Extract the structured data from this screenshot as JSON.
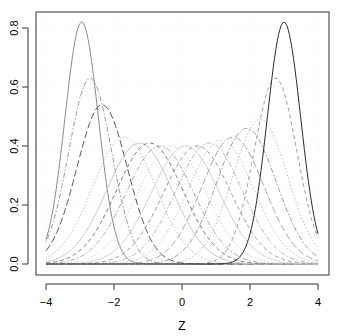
{
  "chart_data": {
    "type": "line",
    "title": "",
    "xlabel": "Z",
    "ylabel": "",
    "xlim": [
      -4.3,
      4.3
    ],
    "ylim": [
      -0.03,
      0.86
    ],
    "x_ticks": [
      -4,
      -2,
      0,
      2,
      4
    ],
    "x_tick_labels": [
      "-4",
      "-2",
      "0",
      "2",
      "4"
    ],
    "y_ticks": [
      0.0,
      0.2,
      0.4,
      0.6,
      0.8
    ],
    "y_tick_labels": [
      "0.0",
      "0.2",
      "0.4",
      "0.6",
      "0.8"
    ],
    "grid": true,
    "legend": null,
    "x_range_plotted": [
      -4,
      4
    ],
    "series": [
      {
        "name": "c1",
        "mean": -2.95,
        "sd": 0.49,
        "peak": 0.82,
        "color": "#8a8a8a",
        "dash": "solid"
      },
      {
        "name": "c2",
        "mean": -2.7,
        "sd": 0.63,
        "peak": 0.63,
        "color": "#9a9a9a",
        "dash": "dotdash"
      },
      {
        "name": "c3",
        "mean": -2.35,
        "sd": 0.74,
        "peak": 0.54,
        "color": "#555555",
        "dash": "longdash"
      },
      {
        "name": "c4",
        "mean": -1.7,
        "sd": 0.93,
        "peak": 0.43,
        "color": "#bdbdbd",
        "dash": "dotted"
      },
      {
        "name": "c5",
        "mean": -1.25,
        "sd": 0.97,
        "peak": 0.41,
        "color": "#c8c8c8",
        "dash": "solid"
      },
      {
        "name": "c6",
        "mean": -0.95,
        "sd": 0.98,
        "peak": 0.41,
        "color": "#777777",
        "dash": "dashed"
      },
      {
        "name": "c7",
        "mean": -0.65,
        "sd": 0.99,
        "peak": 0.4,
        "color": "#aaaaaa",
        "dash": "dotdash"
      },
      {
        "name": "c8",
        "mean": -0.3,
        "sd": 1.0,
        "peak": 0.4,
        "color": "#d0d0d0",
        "dash": "dotted"
      },
      {
        "name": "c9",
        "mean": 0.1,
        "sd": 1.0,
        "peak": 0.4,
        "color": "#cfcfcf",
        "dash": "solid"
      },
      {
        "name": "c10",
        "mean": 0.45,
        "sd": 0.99,
        "peak": 0.4,
        "color": "#9c9c9c",
        "dash": "dashed"
      },
      {
        "name": "c11",
        "mean": 0.8,
        "sd": 0.98,
        "peak": 0.41,
        "color": "#b5b5b5",
        "dash": "dotdash"
      },
      {
        "name": "c12",
        "mean": 1.15,
        "sd": 0.96,
        "peak": 0.42,
        "color": "#c4c4c4",
        "dash": "dotted"
      },
      {
        "name": "c13",
        "mean": 1.5,
        "sd": 0.92,
        "peak": 0.43,
        "color": "#a8a8a8",
        "dash": "longdash"
      },
      {
        "name": "c14",
        "mean": 1.9,
        "sd": 0.87,
        "peak": 0.46,
        "color": "#9a9a9a",
        "dash": "dotdash"
      },
      {
        "name": "c15",
        "mean": 2.3,
        "sd": 0.81,
        "peak": 0.49,
        "color": "#bcbcbc",
        "dash": "dotted"
      },
      {
        "name": "c16",
        "mean": 2.75,
        "sd": 0.63,
        "peak": 0.63,
        "color": "#a0a0a0",
        "dash": "dashed"
      },
      {
        "name": "c17",
        "mean": 3.0,
        "sd": 0.49,
        "peak": 0.82,
        "color": "#2b2b2b",
        "dash": "solid"
      }
    ]
  },
  "axes": {
    "x_title": "Z"
  }
}
